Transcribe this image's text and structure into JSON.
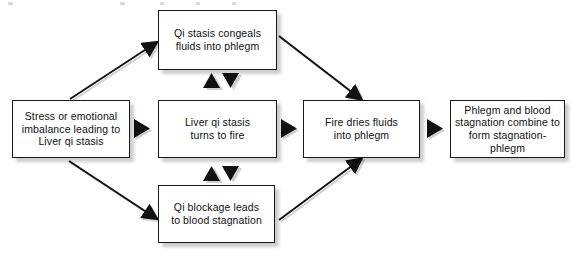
{
  "diagram": {
    "type": "flowchart",
    "background_color": "#ffffff",
    "box_border_color": "#1a1a1a",
    "box_fill_color": "#ffffff",
    "arrow_color": "#111111",
    "shadow_color": "#cccccc",
    "nodes": [
      {
        "id": "stress",
        "label": "Stress or emotional\nimbalance leading to\nLiver qi stasis"
      },
      {
        "id": "congeal",
        "label": "Qi stasis congeals\nfluids into phlegm"
      },
      {
        "id": "turns_to_fire",
        "label": "Liver qi stasis\nturns to fire"
      },
      {
        "id": "blockage",
        "label": "Qi blockage leads\nto blood stagnation"
      },
      {
        "id": "fire_dries",
        "label": "Fire dries fluids\ninto phlegm"
      },
      {
        "id": "combine",
        "label": "Phlegm and blood\nstagnation combine to\nform stagnation-phlegm"
      }
    ],
    "edges": [
      {
        "from": "stress",
        "to": "congeal",
        "style": "diagonal-up-right"
      },
      {
        "from": "stress",
        "to": "turns_to_fire",
        "style": "horizontal-right"
      },
      {
        "from": "stress",
        "to": "blockage",
        "style": "diagonal-down-right"
      },
      {
        "from": "congeal",
        "to": "fire_dries",
        "style": "diagonal-down-right"
      },
      {
        "from": "turns_to_fire",
        "to": "congeal",
        "style": "vertical-up"
      },
      {
        "from": "congeal",
        "to": "turns_to_fire",
        "style": "vertical-down"
      },
      {
        "from": "turns_to_fire",
        "to": "blockage",
        "style": "vertical-down"
      },
      {
        "from": "blockage",
        "to": "turns_to_fire",
        "style": "vertical-up"
      },
      {
        "from": "turns_to_fire",
        "to": "fire_dries",
        "style": "horizontal-right"
      },
      {
        "from": "blockage",
        "to": "fire_dries",
        "style": "diagonal-up-right"
      },
      {
        "from": "fire_dries",
        "to": "combine",
        "style": "horizontal-right"
      }
    ]
  }
}
